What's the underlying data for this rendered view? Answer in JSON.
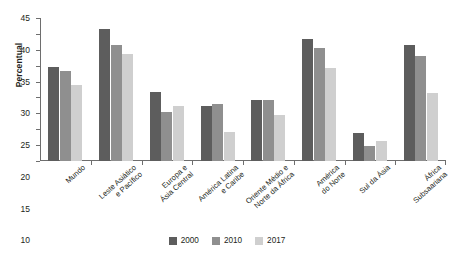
{
  "chart_data": {
    "type": "bar",
    "title": "",
    "xlabel": "",
    "ylabel": "Percentual",
    "ylim": [
      0,
      45
    ],
    "ytick_step": 5,
    "yticks": [
      0,
      5,
      10,
      15,
      20,
      25,
      30,
      35,
      40,
      45
    ],
    "grid": false,
    "legend_position": "bottom",
    "categories": [
      "Mundo",
      "Leste Asiático\ne Pacífico",
      "Europa e\nÁsia Central",
      "América Latina\ne Caribe",
      "Oriente Médio e\nNorte da África",
      "América\ndo Norte",
      "Sul da Ásia",
      "África\nSubsaariana"
    ],
    "series": [
      {
        "name": "2000",
        "color": "#5d5d5d",
        "values": [
          29.5,
          41.5,
          21.7,
          17.2,
          19.3,
          38.5,
          8.7,
          36.5
        ]
      },
      {
        "name": "2010",
        "color": "#8f8f8f",
        "values": [
          28.2,
          36.4,
          15.3,
          17.8,
          19.2,
          35.6,
          4.8,
          33.2
        ]
      },
      {
        "name": "2017",
        "color": "#cfcfcf",
        "values": [
          23.8,
          33.7,
          17.3,
          9.0,
          14.6,
          29.4,
          6.2,
          21.3
        ]
      }
    ]
  }
}
